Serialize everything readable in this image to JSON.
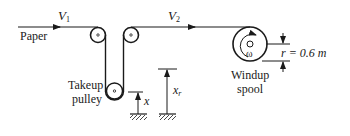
{
  "diagram": {
    "labels": {
      "paper": "Paper",
      "v1": "V",
      "v1_sub": "1",
      "v2": "V",
      "v2_sub": "2",
      "takeup_line1": "Takeup",
      "takeup_line2": "pulley",
      "x": "x",
      "xr": "x",
      "xr_sub": "r",
      "omega": "ω",
      "radius": "r = 0.6 m",
      "windup_line1": "Windup",
      "windup_line2": "spool"
    },
    "colors": {
      "stroke": "#1a1a1a",
      "background": "#ffffff"
    }
  }
}
